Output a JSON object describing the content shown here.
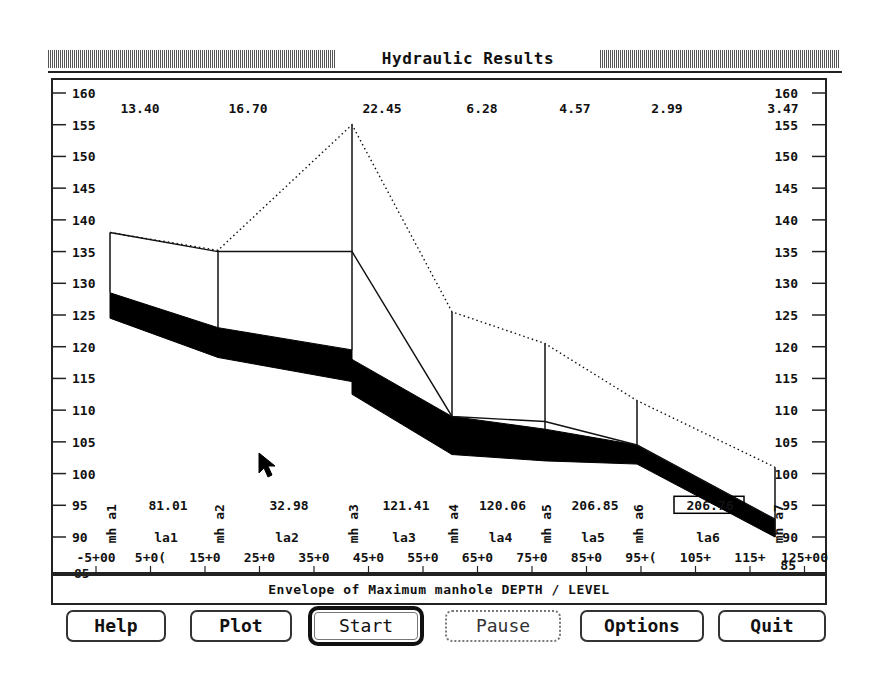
{
  "window": {
    "title": "Hydraulic Results"
  },
  "caption": "Envelope of Maximum manhole DEPTH / LEVEL",
  "buttons": [
    {
      "label": "Help",
      "state": "normal"
    },
    {
      "label": "Plot",
      "state": "normal"
    },
    {
      "label": "Start",
      "state": "active"
    },
    {
      "label": "Pause",
      "state": "disabled"
    },
    {
      "label": "Options",
      "state": "normal"
    },
    {
      "label": "Quit",
      "state": "normal"
    }
  ],
  "colors": {
    "fg": "#111111",
    "bg": "#ffffff",
    "hatch": "#555555"
  },
  "chart_data": {
    "type": "line",
    "title": "Hydraulic Results",
    "subtitle": "Envelope of Maximum manhole DEPTH / LEVEL",
    "xlabel": "Chainage",
    "ylabel": "Level",
    "ylim": [
      85,
      160
    ],
    "y_ticks": [
      160,
      155,
      150,
      145,
      140,
      135,
      130,
      125,
      120,
      115,
      110,
      105,
      100,
      95,
      90,
      85
    ],
    "x_ticks": [
      "-5+00",
      "5+00",
      "15+00",
      "25+00",
      "35+00",
      "45+00",
      "55+00",
      "65+00",
      "75+00",
      "85+00",
      "95+00",
      "105+00",
      "115+00",
      "125+00"
    ],
    "x_tick_labels_displayed": [
      "-5+00",
      "5+0(",
      "15+0",
      "25+0",
      "35+0",
      "45+0",
      "55+0",
      "65+0",
      "75+0",
      "85+0",
      "95+(",
      "105+",
      "115+",
      "125+00"
    ],
    "manholes": [
      "mh a1",
      "mh a2",
      "mh a3",
      "mh a4",
      "mh a5",
      "mh a6",
      "mh a7"
    ],
    "manhole_depths_top": [
      "13.40",
      "16.70",
      "22.45",
      "6.28",
      "4.57",
      "2.99",
      "3.47"
    ],
    "links": [
      "la1",
      "la2",
      "la3",
      "la4",
      "la5",
      "la6"
    ],
    "link_lengths": [
      "81.01",
      "32.98",
      "121.41",
      "120.06",
      "206.85",
      "206.76"
    ],
    "series": [
      {
        "name": "Ground level (dotted)",
        "values": [
          138.0,
          135.2,
          155.0,
          125.5,
          120.5,
          111.5,
          101.0
        ]
      },
      {
        "name": "Max water level",
        "values": [
          138.0,
          135.0,
          135.0,
          109.0,
          108.2,
          104.5,
          92.8
        ]
      },
      {
        "name": "Pipe soffit (upstream/downstream)",
        "values": [
          [
            128.5,
            123.0
          ],
          [
            123.0,
            119.5
          ],
          [
            118.0,
            109.0
          ],
          [
            109.0,
            107.0
          ],
          [
            107.0,
            104.5
          ],
          [
            104.5,
            92.8
          ]
        ]
      },
      {
        "name": "Pipe invert (upstream/downstream)",
        "values": [
          [
            124.5,
            118.3
          ],
          [
            118.3,
            114.5
          ],
          [
            112.5,
            103.0
          ],
          [
            103.0,
            102.0
          ],
          [
            102.0,
            101.5
          ],
          [
            101.5,
            90.0
          ]
        ]
      }
    ],
    "grid": false,
    "legend": "none"
  }
}
